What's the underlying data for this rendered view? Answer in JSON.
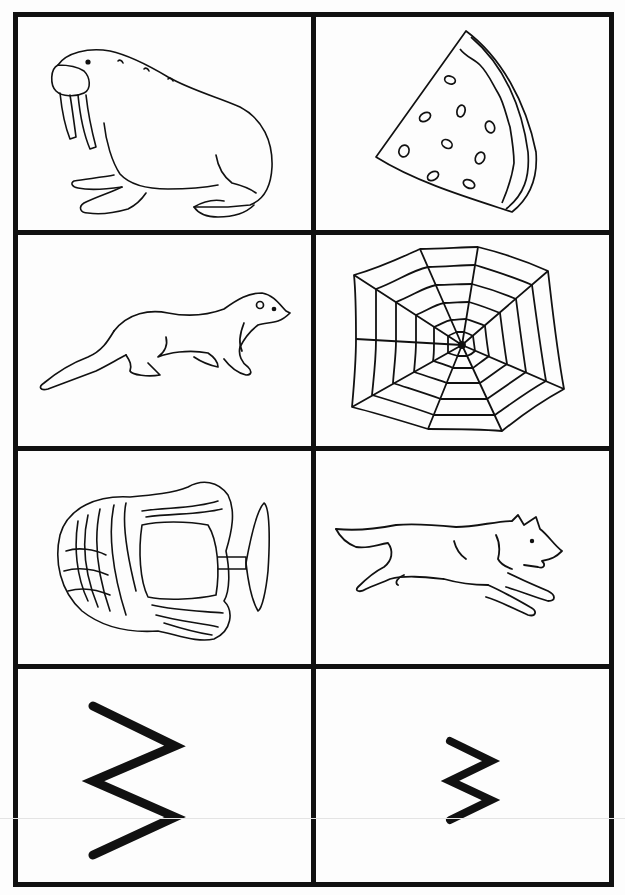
{
  "worksheet": {
    "theme_letter": "W",
    "layout": {
      "rows": 4,
      "columns": 2
    },
    "line_color": "#111111",
    "background_color": "#ffffff",
    "cards": [
      {
        "row": 1,
        "col": 1,
        "type": "picture",
        "subject": "walrus",
        "icon": "walrus-icon"
      },
      {
        "row": 1,
        "col": 2,
        "type": "picture",
        "subject": "watermelon",
        "icon": "watermelon-slice-icon"
      },
      {
        "row": 2,
        "col": 1,
        "type": "picture",
        "subject": "weasel",
        "icon": "weasel-icon"
      },
      {
        "row": 2,
        "col": 2,
        "type": "picture",
        "subject": "web",
        "icon": "spider-web-icon"
      },
      {
        "row": 3,
        "col": 1,
        "type": "picture",
        "subject": "wig",
        "icon": "wig-on-stand-icon"
      },
      {
        "row": 3,
        "col": 2,
        "type": "picture",
        "subject": "wolf",
        "icon": "wolf-icon"
      },
      {
        "row": 4,
        "col": 1,
        "type": "letter",
        "subject": "uppercase W (rotated)",
        "icon": "uppercase-w-icon"
      },
      {
        "row": 4,
        "col": 2,
        "type": "letter",
        "subject": "lowercase w (rotated)",
        "icon": "lowercase-w-icon"
      }
    ]
  }
}
